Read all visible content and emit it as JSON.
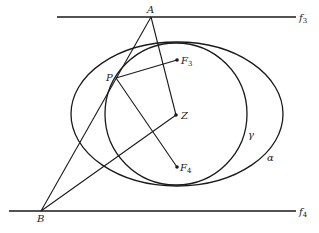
{
  "diagram": {
    "colors": {
      "stroke": "#1a1a1a",
      "background": "#ffffff",
      "label": "#222222"
    },
    "lines": {
      "f3": {
        "label": "f",
        "sub": "3",
        "x1": 57,
        "y": 17,
        "x2": 296
      },
      "f4": {
        "label": "f",
        "sub": "4",
        "x1": 9,
        "y": 211,
        "x2": 296
      }
    },
    "points": {
      "A": {
        "label": "A",
        "x": 151,
        "y": 17
      },
      "B": {
        "label": "B",
        "x": 41,
        "y": 211
      },
      "P": {
        "label": "P",
        "x": 116,
        "y": 78
      },
      "F3": {
        "label": "F",
        "sub": "3",
        "x": 177,
        "y": 60
      },
      "Z": {
        "label": "Z",
        "x": 176,
        "y": 115
      },
      "F4": {
        "label": "F",
        "sub": "4",
        "x": 177,
        "y": 167
      }
    },
    "curves": {
      "alpha": {
        "label": "α",
        "cx": 177,
        "cy": 114,
        "rx": 106,
        "ry": 72
      },
      "gamma": {
        "label": "γ",
        "cx": 176,
        "cy": 114,
        "r": 71
      }
    },
    "segments": [
      [
        "A",
        "B"
      ],
      [
        "A",
        "Z"
      ],
      [
        "B",
        "Z"
      ],
      [
        "P",
        "F3"
      ],
      [
        "P",
        "F4"
      ]
    ]
  }
}
